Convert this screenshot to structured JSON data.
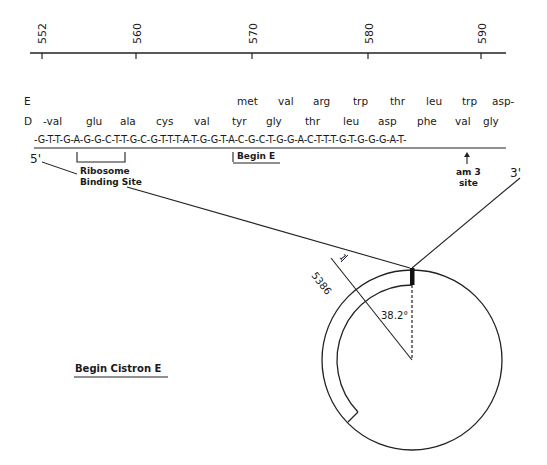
{
  "axis": {
    "ticks": [
      {
        "label": "552",
        "x": 43
      },
      {
        "label": "560",
        "x": 136
      },
      {
        "label": "570",
        "x": 252
      },
      {
        "label": "580",
        "x": 368
      },
      {
        "label": "590",
        "x": 481
      }
    ]
  },
  "rows": {
    "E_label": "E",
    "D_label": "D",
    "E_residues": [
      {
        "aa": "met",
        "x": 237
      },
      {
        "aa": "val",
        "x": 278
      },
      {
        "aa": "arg",
        "x": 313
      },
      {
        "aa": "trp",
        "x": 353
      },
      {
        "aa": "thr",
        "x": 390
      },
      {
        "aa": "leu",
        "x": 426
      },
      {
        "aa": "trp",
        "x": 462
      },
      {
        "aa": "asp-",
        "x": 492
      }
    ],
    "D_residues": [
      {
        "aa": "-val",
        "x": 45
      },
      {
        "aa": "glu",
        "x": 86
      },
      {
        "aa": "ala",
        "x": 120
      },
      {
        "aa": "cys",
        "x": 156
      },
      {
        "aa": "val",
        "x": 194
      },
      {
        "aa": "tyr",
        "x": 232
      },
      {
        "aa": "gly",
        "x": 266
      },
      {
        "aa": "thr",
        "x": 305
      },
      {
        "aa": "leu",
        "x": 343
      },
      {
        "aa": "asp",
        "x": 378
      },
      {
        "aa": "phe",
        "x": 417
      },
      {
        "aa": "val",
        "x": 455
      },
      {
        "aa": "gly",
        "x": 480
      }
    ]
  },
  "sequence": "-G-T-T-G-A-G-G-C-T-T-G-C-G-T-T-T-A-T-G-G-T-A-C-G-C-T-G-G-A-C-T-T-T-G-T-G-G-G-A-T-",
  "labels": {
    "five_prime": "5'",
    "three_prime": "3'",
    "rbs_line1": "Ribosome",
    "rbs_line2": "Binding Site",
    "begin_e": "Begin E",
    "am3_line1": "am 3",
    "am3_line2": "site",
    "begin_cistron": "Begin Cistron E",
    "genome_end": "5386",
    "genome_start": "1",
    "angle": "38.2°"
  }
}
